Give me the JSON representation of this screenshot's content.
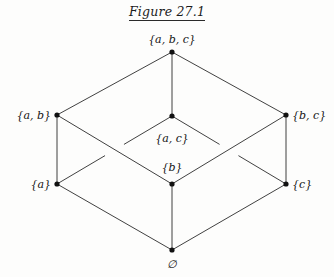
{
  "figure": {
    "title": "Figure 27.1",
    "kind": "hasse-diagram"
  },
  "canvas": {
    "width": 334,
    "height": 277,
    "background": "#fdfdfc"
  },
  "style": {
    "edge_color": "#2b2b2b",
    "edge_width": 0.9,
    "node_color": "#111111",
    "node_radius": 2.6,
    "label_color": "#131313"
  },
  "nodes": [
    {
      "id": "abc",
      "label": "{a, b, c}",
      "x": 172,
      "y": 52,
      "label_x": 172,
      "label_y": 39,
      "label_pos": "center"
    },
    {
      "id": "ab",
      "label": "{a, b}",
      "x": 57,
      "y": 115,
      "label_x": 51,
      "label_y": 115,
      "label_pos": "left"
    },
    {
      "id": "ac",
      "label": "{a, c}",
      "x": 172,
      "y": 116,
      "label_x": 172,
      "label_y": 138,
      "label_pos": "center"
    },
    {
      "id": "bc",
      "label": "{b, c}",
      "x": 286,
      "y": 115,
      "label_x": 292,
      "label_y": 115,
      "label_pos": "right"
    },
    {
      "id": "a",
      "label": "{a}",
      "x": 57,
      "y": 184,
      "label_x": 51,
      "label_y": 184,
      "label_pos": "left"
    },
    {
      "id": "b",
      "label": "{b}",
      "x": 172,
      "y": 184,
      "label_x": 172,
      "label_y": 167,
      "label_pos": "center"
    },
    {
      "id": "c",
      "label": "{c}",
      "x": 286,
      "y": 184,
      "label_x": 292,
      "label_y": 184,
      "label_pos": "right"
    },
    {
      "id": "empty",
      "label": "∅",
      "x": 172,
      "y": 250,
      "label_x": 172,
      "label_y": 264,
      "label_pos": "center"
    }
  ],
  "edges": [
    {
      "from": "abc",
      "to": "ab",
      "hidden": false
    },
    {
      "from": "abc",
      "to": "ac",
      "hidden": false
    },
    {
      "from": "abc",
      "to": "bc",
      "hidden": false
    },
    {
      "from": "ab",
      "to": "a",
      "hidden": false
    },
    {
      "from": "ab",
      "to": "b",
      "hidden": false
    },
    {
      "from": "ac",
      "to": "a",
      "hidden": true
    },
    {
      "from": "ac",
      "to": "c",
      "hidden": true
    },
    {
      "from": "bc",
      "to": "b",
      "hidden": false
    },
    {
      "from": "bc",
      "to": "c",
      "hidden": false
    },
    {
      "from": "a",
      "to": "empty",
      "hidden": false
    },
    {
      "from": "b",
      "to": "empty",
      "hidden": false
    },
    {
      "from": "c",
      "to": "empty",
      "hidden": false
    }
  ],
  "chart_data": {
    "type": "diagram",
    "title": "Figure 27.1",
    "subtitle": "",
    "nodes": [
      "{a, b, c}",
      "{a, b}",
      "{a, c}",
      "{b, c}",
      "{a}",
      "{b}",
      "{c}",
      "∅"
    ],
    "edges": [
      [
        "{a, b, c}",
        "{a, b}"
      ],
      [
        "{a, b, c}",
        "{a, c}"
      ],
      [
        "{a, b, c}",
        "{b, c}"
      ],
      [
        "{a, b}",
        "{a}"
      ],
      [
        "{a, b}",
        "{b}"
      ],
      [
        "{a, c}",
        "{a}"
      ],
      [
        "{a, c}",
        "{c}"
      ],
      [
        "{b, c}",
        "{b}"
      ],
      [
        "{b, c}",
        "{c}"
      ],
      [
        "{a}",
        "∅"
      ],
      [
        "{b}",
        "∅"
      ],
      [
        "{c}",
        "∅"
      ]
    ],
    "levels": [
      {
        "rank": 3,
        "members": [
          "{a, b, c}"
        ]
      },
      {
        "rank": 2,
        "members": [
          "{a, b}",
          "{a, c}",
          "{b, c}"
        ]
      },
      {
        "rank": 1,
        "members": [
          "{a}",
          "{b}",
          "{c}"
        ]
      },
      {
        "rank": 0,
        "members": [
          "∅"
        ]
      }
    ],
    "legend": [],
    "grid": false
  }
}
